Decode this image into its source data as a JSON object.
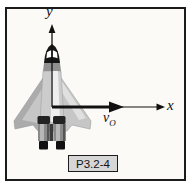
{
  "figure": {
    "label": "P3.2-4",
    "axes": {
      "y_label": "y",
      "x_label": "x"
    },
    "vectors": {
      "velocity": {
        "base": "v",
        "subscript": "O",
        "direction": "+x"
      }
    },
    "illustration": "space-shuttle-top-view",
    "origin_at": "shuttle center",
    "colors": {
      "frame_border": "#1b1b1b",
      "frame_background": "#fbfaf7",
      "label_box_fill": "#d6d6d6",
      "axis_ink": "#111111",
      "shuttle_wing": "#c6c6c6",
      "shuttle_wing_shadow": "#a2a2a2",
      "shuttle_fuselage": "#cccccc",
      "shuttle_highlight": "#eeeeee",
      "shuttle_nose": "#161616",
      "shuttle_nozzle": "#8a8a8a"
    }
  }
}
